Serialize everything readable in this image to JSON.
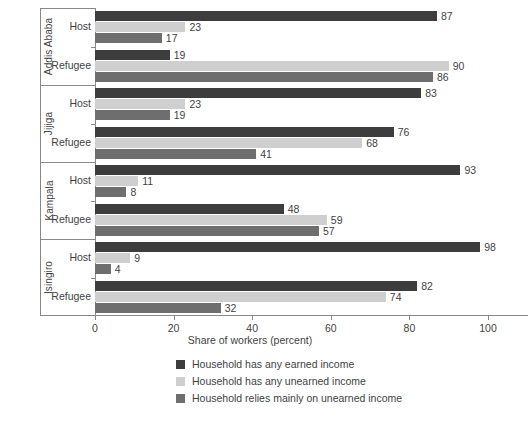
{
  "chart_data": {
    "type": "bar",
    "orientation": "horizontal",
    "title": "",
    "xlabel": "Share of workers (percent)",
    "ylabel": "",
    "xlim": [
      0,
      100
    ],
    "xticks": [
      0,
      20,
      40,
      60,
      80,
      100
    ],
    "grid": false,
    "legend_position": "bottom",
    "series": [
      {
        "name": "Household has any earned income",
        "color": "#3d3d3d"
      },
      {
        "name": "Household has any unearned income",
        "color": "#cfcfcf"
      },
      {
        "name": "Household relies mainly on unearned income",
        "color": "#6e6e6e"
      }
    ],
    "groups": [
      {
        "city": "Addis Ababa",
        "categories": [
          {
            "label": "Host",
            "values": [
              87,
              23,
              17
            ]
          },
          {
            "label": "Refugee",
            "values": [
              19,
              90,
              86
            ]
          }
        ]
      },
      {
        "city": "Jijiga",
        "categories": [
          {
            "label": "Host",
            "values": [
              83,
              23,
              19
            ]
          },
          {
            "label": "Refugee",
            "values": [
              76,
              68,
              41
            ]
          }
        ]
      },
      {
        "city": "Kampala",
        "categories": [
          {
            "label": "Host",
            "values": [
              93,
              11,
              8
            ]
          },
          {
            "label": "Refugee",
            "values": [
              48,
              59,
              57
            ]
          }
        ]
      },
      {
        "city": "Isingiro",
        "categories": [
          {
            "label": "Host",
            "values": [
              98,
              9,
              4
            ]
          },
          {
            "label": "Refugee",
            "values": [
              82,
              74,
              32
            ]
          }
        ]
      }
    ]
  },
  "axis": {
    "tick_labels": [
      "0",
      "20",
      "40",
      "60",
      "80",
      "100"
    ],
    "x_title": "Share of workers (percent)"
  },
  "legend": {
    "items": [
      {
        "label": "Household has any earned income",
        "color": "#3d3d3d"
      },
      {
        "label": "Household has any unearned income",
        "color": "#cfcfcf"
      },
      {
        "label": "Household relies mainly on unearned income",
        "color": "#6e6e6e"
      }
    ]
  },
  "colors": {
    "earned": "#3d3d3d",
    "unearned": "#cfcfcf",
    "relies": "#6e6e6e",
    "axis": "#8a8a8a",
    "text": "#3f3f3f",
    "background": "#ffffff"
  }
}
